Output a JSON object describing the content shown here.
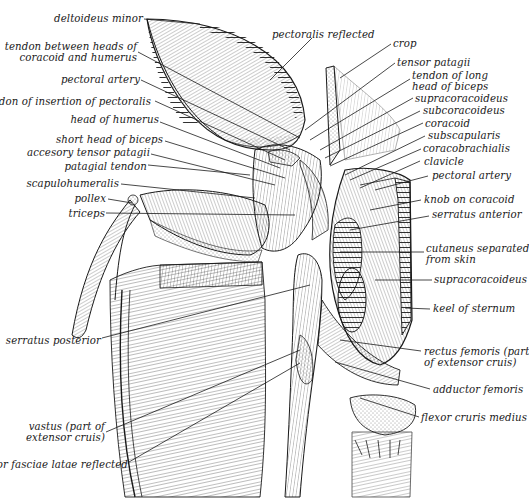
{
  "figure": {
    "ink_color": "#1a1a1a",
    "paper_color": "#ffffff",
    "labels_left": [
      {
        "id": "deltoideus-minor",
        "text": "deltoideus minor",
        "x": 143,
        "y": 13,
        "w": 0,
        "line": [
          144,
          19,
          200,
          24
        ]
      },
      {
        "id": "tendon-between-heads",
        "text": "tendon between heads of\ncoracoid and humerus",
        "x": 137,
        "y": 41,
        "w": 0,
        "line": [
          138,
          52,
          300,
          138
        ]
      },
      {
        "id": "pectoral-artery-left",
        "text": "pectoral artery",
        "x": 140,
        "y": 74,
        "w": 0,
        "line": [
          141,
          80,
          290,
          150
        ]
      },
      {
        "id": "tendon-insertion-pectoralis",
        "text": "tendon of insertion of pectoralis",
        "x": 151,
        "y": 96,
        "w": 0,
        "line": [
          155,
          101,
          285,
          160
        ]
      },
      {
        "id": "head-of-humerus",
        "text": "head of humerus",
        "x": 159,
        "y": 114,
        "w": 0,
        "line": [
          160,
          122,
          280,
          168
        ]
      },
      {
        "id": "short-head-biceps",
        "text": "short head of biceps",
        "x": 163,
        "y": 134,
        "w": 0,
        "line": [
          165,
          141,
          285,
          178
        ]
      },
      {
        "id": "accesory-tensor-patagii",
        "text": "accesory tensor patagii",
        "x": 150,
        "y": 147,
        "w": 0,
        "line": [
          151,
          154,
          275,
          185
        ]
      },
      {
        "id": "patagial-tendon",
        "text": "patagial tendon",
        "x": 147,
        "y": 161,
        "w": 0,
        "line": [
          148,
          165,
          250,
          175
        ]
      },
      {
        "id": "scapulohumeralis",
        "text": "scapulohumeralis",
        "x": 119,
        "y": 178,
        "w": 0,
        "line": [
          121,
          184,
          255,
          198
        ]
      },
      {
        "id": "pollex",
        "text": "pollex",
        "x": 106,
        "y": 193,
        "w": 0,
        "line": [
          108,
          199,
          132,
          203
        ]
      },
      {
        "id": "triceps",
        "text": "triceps",
        "x": 105,
        "y": 208,
        "w": 0,
        "line": [
          106,
          213,
          295,
          215
        ]
      },
      {
        "id": "serratus-posterior",
        "text": "serratus posterior",
        "x": 101,
        "y": 335,
        "w": 0,
        "line": [
          102,
          338,
          310,
          285
        ]
      },
      {
        "id": "vastus",
        "text": "vastus (part of\nextensor cruis)",
        "x": 105,
        "y": 421,
        "w": 0,
        "line": [
          106,
          432,
          300,
          350
        ]
      },
      {
        "id": "tensor-fasciae-latae",
        "text": "tensor fasciae latae reflected",
        "x": 128,
        "y": 459,
        "w": 0,
        "line": [
          129,
          462,
          300,
          363
        ]
      }
    ],
    "labels_right": [
      {
        "id": "pectoralis-reflected",
        "text": "pectoralis reflected",
        "x": 272,
        "y": 29,
        "line": [
          312,
          38,
          270,
          80
        ]
      },
      {
        "id": "crop",
        "text": "crop",
        "x": 393,
        "y": 38,
        "line": [
          391,
          44,
          340,
          78
        ]
      },
      {
        "id": "tensor-patagii",
        "text": "tensor patagii",
        "x": 397,
        "y": 57,
        "line": [
          395,
          63,
          305,
          130
        ]
      },
      {
        "id": "tendon-long-head-biceps",
        "text": "tendon of long\nhead of biceps",
        "x": 412,
        "y": 70,
        "line": [
          410,
          79,
          310,
          140
        ]
      },
      {
        "id": "supracoracoideus-top",
        "text": "supracoracoideus",
        "x": 415,
        "y": 93,
        "line": [
          413,
          98,
          320,
          150
        ]
      },
      {
        "id": "subcoracoideus",
        "text": "subcoracoideus",
        "x": 423,
        "y": 105,
        "line": [
          420,
          111,
          325,
          158
        ]
      },
      {
        "id": "coracoid",
        "text": "coracoid",
        "x": 425,
        "y": 118,
        "line": [
          423,
          123,
          330,
          166
        ]
      },
      {
        "id": "subscapularis",
        "text": "subscapularis",
        "x": 428,
        "y": 130,
        "line": [
          425,
          136,
          345,
          175
        ]
      },
      {
        "id": "coracobrachialis",
        "text": "coracobrachialis",
        "x": 423,
        "y": 143,
        "line": [
          421,
          149,
          350,
          180
        ]
      },
      {
        "id": "clavicle",
        "text": "clavicle",
        "x": 424,
        "y": 156,
        "line": [
          420,
          161,
          360,
          188
        ]
      },
      {
        "id": "pectoral-artery-right",
        "text": "pectoral artery",
        "x": 432,
        "y": 170,
        "line": [
          428,
          176,
          375,
          190
        ]
      },
      {
        "id": "knob-on-coracoid",
        "text": "knob on coracoid",
        "x": 424,
        "y": 194,
        "line": [
          421,
          200,
          370,
          210
        ]
      },
      {
        "id": "serratus-anterior",
        "text": "serratus anterior",
        "x": 432,
        "y": 209,
        "line": [
          429,
          216,
          350,
          230
        ]
      },
      {
        "id": "cutaneus",
        "text": "cutaneus separated\nfrom skin",
        "x": 426,
        "y": 243,
        "line": [
          424,
          252,
          340,
          252
        ]
      },
      {
        "id": "supracoracoideus-bottom",
        "text": "supracoracoideus",
        "x": 434,
        "y": 274,
        "line": [
          432,
          280,
          375,
          280
        ]
      },
      {
        "id": "keel-of-sternum",
        "text": "keel of sternum",
        "x": 433,
        "y": 303,
        "line": [
          430,
          309,
          405,
          308
        ]
      },
      {
        "id": "rectus-femoris",
        "text": "rectus femoris (part\nof extensor cruis)",
        "x": 424,
        "y": 346,
        "line": [
          421,
          351,
          340,
          340
        ]
      },
      {
        "id": "adductor-femoris",
        "text": "adductor femoris",
        "x": 433,
        "y": 384,
        "line": [
          430,
          389,
          335,
          362
        ]
      },
      {
        "id": "flexor-cruris-medius",
        "text": "flexor cruris medius",
        "x": 421,
        "y": 412,
        "line": [
          419,
          417,
          360,
          398
        ]
      }
    ]
  }
}
